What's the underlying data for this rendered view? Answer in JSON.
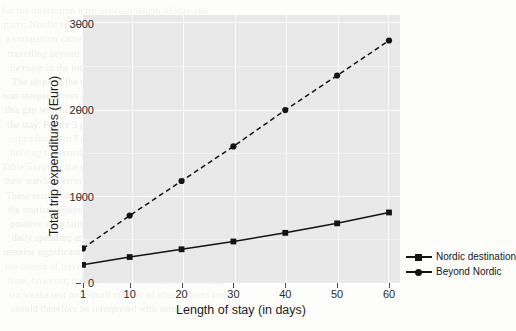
{
  "chart_data": {
    "type": "line",
    "title": "",
    "xlabel": "Length of stay (in days)",
    "ylabel": "Total trip expenditures (Euro)",
    "x": [
      1,
      10,
      20,
      30,
      40,
      50,
      60
    ],
    "xticklabels": [
      "1",
      "10",
      "20",
      "30",
      "40",
      "50",
      "60"
    ],
    "yticklabels": [
      "0",
      "1000",
      "2000",
      "3000"
    ],
    "yticks": [
      0,
      1000,
      2000,
      3000
    ],
    "xlim": [
      1,
      60
    ],
    "ylim": [
      0,
      3100
    ],
    "grid": true,
    "legend_position": "right",
    "series": [
      {
        "name": "Nordic destination",
        "marker": "square",
        "linestyle": "solid",
        "color": "#141414",
        "values": [
          210,
          300,
          390,
          480,
          580,
          690,
          816
        ]
      },
      {
        "name": "Beyond Nordic",
        "marker": "circle",
        "linestyle": "dashed",
        "color": "#141414",
        "values": [
          400,
          780,
          1180,
          1580,
          2000,
          2400,
          2805
        ]
      }
    ]
  },
  "legend": {
    "items": [
      {
        "label": "Nordic destination"
      },
      {
        "label": "Beyond Nordic"
      }
    ]
  },
  "axes": {
    "y_title": "Total trip expenditures (Euro)",
    "x_title": "Length of stay (in days)"
  },
  "background_text": {
    "lines": [
      "for the interaction term between length of stay and",
      "party. Nordic respondents tended to spend more when",
      "a companion came along for the stay, whereas visitors",
      "travelling beyond the Nordic area reported a sharper",
      "increase in the total expenditures with each extra day.",
      "The slope of the regression line in the dashed series",
      "was steeper across all of the observed intervals, and",
      "this gap widened considerably after the third week of",
      "the stay. Figure 3 presents the predicted total trip",
      "expenditures in Euro for the two groups of travellers,",
      "holding the remaining covariates at their sample means.",
      "Table 5 reports the corresponding marginal effects and",
      "their standard errors for each of the model terms.",
      "These results are consistent with earlier findings in",
      "the tourism economics literature, which documents a",
      "positive association between distance travelled and",
      "daily spending at the destination. The interaction",
      "remains significant when controlling for income and",
      "the season of travel, as shown in the appendix.",
      "Note, however, that the estimates for stays exceeding",
      "six weeks rest on a small number of observations and",
      "should therefore be interpreted with some caution."
    ]
  }
}
